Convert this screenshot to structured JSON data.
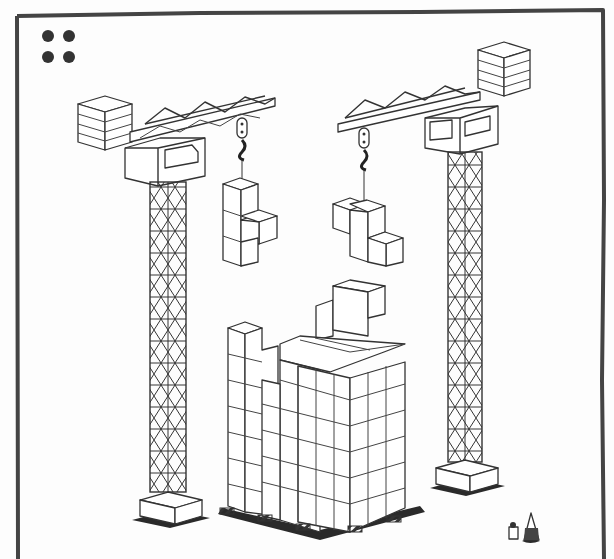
{
  "illustration": {
    "subject": "construction site with two tower cranes stacking cubes",
    "frame_color": "#444444",
    "line_color": "#333333",
    "background": "#fdfdfd",
    "corner_dots": 4
  },
  "cranes": [
    {
      "name": "left-crane",
      "counterweight_slabs": 4,
      "jib_direction": "right",
      "carrying": "T-shaped cube piece (4 cubes)"
    },
    {
      "name": "right-crane",
      "counterweight_slabs": 4,
      "jib_direction": "left",
      "carrying": "S-shaped cube piece (4 cubes)"
    }
  ],
  "building": {
    "description": "stacked cube building under construction",
    "barriers": 5
  },
  "figures": {
    "description": "two small workers in lower right corner"
  }
}
